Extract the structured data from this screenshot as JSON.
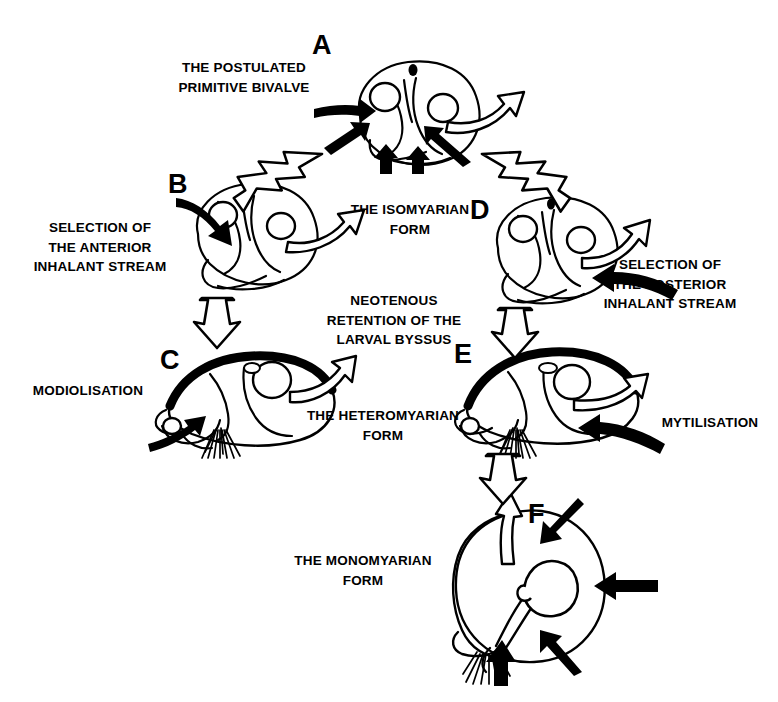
{
  "diagram": {
    "background_color": "#ffffff",
    "ink_color": "#000000",
    "width": 778,
    "height": 702
  },
  "stages": [
    {
      "id": "A",
      "letter": "A",
      "name": "the-postulated-primitive-bivalve",
      "caption": "THE POSTULATED\nPRIMITIVE BIVALVE",
      "form_label": "THE ISOMYARIAN\nFORM",
      "muscles": "isomyarian (two equal adductors)",
      "inhalant_arrows": 4,
      "exhalant_arrows": 1
    },
    {
      "id": "B",
      "letter": "B",
      "name": "anterior-inhalant-selection",
      "caption": "SELECTION OF\nTHE ANTERIOR\nINHALANT STREAM",
      "muscles": "isomyarian",
      "inhalant_arrows": 1,
      "exhalant_arrows": 1
    },
    {
      "id": "C",
      "letter": "C",
      "name": "modiolisation",
      "caption": "MODIOLISATION",
      "form_label": "THE HETEROMYARIAN\nFORM",
      "muscles": "heteromyarian (reduced anterior adductor)",
      "byssus": true,
      "inhalant_arrows": 1,
      "exhalant_arrows": 1
    },
    {
      "id": "D",
      "letter": "D",
      "name": "posterior-inhalant-selection",
      "caption": "SELECTION OF\nTHE POSTERIOR\nINHALANT STREAM",
      "muscles": "isomyarian",
      "inhalant_arrows": 1,
      "exhalant_arrows": 1
    },
    {
      "id": "E",
      "letter": "E",
      "name": "mytilisation",
      "caption": "MYTILISATION",
      "muscles": "heteromyarian (reduced anterior adductor)",
      "byssus": true,
      "inhalant_arrows": 1,
      "exhalant_arrows": 1
    },
    {
      "id": "F",
      "letter": "F",
      "name": "the-monomyarian-form",
      "caption": "THE MONOMYARIAN\nFORM",
      "muscles": "monomyarian (single central adductor)",
      "byssus": true,
      "inhalant_arrows": 4,
      "exhalant_arrows": 1
    }
  ],
  "labels": {
    "postulated_primitive_bivalve": "THE POSTULATED\nPRIMITIVE BIVALVE",
    "isomyarian_form": "THE ISOMYARIAN\nFORM",
    "selection_anterior": "SELECTION OF\nTHE ANTERIOR\nINHALANT STREAM",
    "selection_posterior": "SELECTION OF\nTHE POSTERIOR\nINHALANT STREAM",
    "neotenous_retention": "NEOTENOUS\nRETENTION OF THE\nLARVAL BYSSUS",
    "modiolisation": "MODIOLISATION",
    "mytilisation": "MYTILISATION",
    "heteromyarian_form": "THE HETEROMYARIAN\nFORM",
    "monomyarian_form": "THE MONOMYARIAN\nFORM"
  },
  "transitions": [
    {
      "name": "a-to-b",
      "from": "A",
      "to": "B",
      "style": "hollow-block-arrow",
      "direction": "down-left"
    },
    {
      "name": "a-to-d",
      "from": "A",
      "to": "D",
      "style": "hollow-block-arrow",
      "direction": "down-right"
    },
    {
      "name": "b-to-c",
      "from": "B",
      "to": "C",
      "style": "hollow-block-arrow",
      "direction": "down"
    },
    {
      "name": "d-to-e",
      "from": "D",
      "to": "E",
      "style": "hollow-block-arrow",
      "direction": "down"
    },
    {
      "name": "e-to-f",
      "from": "E",
      "to": "F",
      "style": "hollow-block-arrow",
      "direction": "down"
    }
  ],
  "legend_semantics": {
    "solid_black_arrow": "inhalant water stream",
    "hollow_outline_arrow": "exhalant water stream",
    "hollow_block_arrow": "evolutionary transition"
  }
}
